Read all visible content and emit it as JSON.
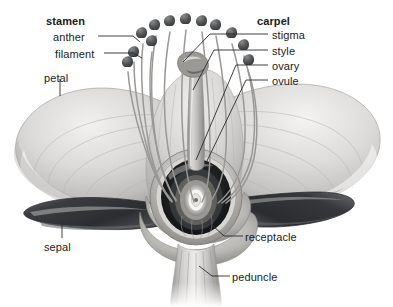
{
  "figure": {
    "background_color": "#ffffff",
    "label_color": "#1a1a1a",
    "leader_color": "#2b2b2b"
  },
  "labels": {
    "stamen": {
      "text": "stamen",
      "x": 46,
      "y": 16,
      "bold": true,
      "align": "left"
    },
    "anther": {
      "text": "anther",
      "x": 53,
      "y": 32,
      "bold": false,
      "align": "left"
    },
    "filament": {
      "text": "filament",
      "x": 55,
      "y": 49,
      "bold": false,
      "align": "left"
    },
    "petal": {
      "text": "petal",
      "x": 44,
      "y": 73,
      "bold": false,
      "align": "left"
    },
    "carpel": {
      "text": "carpel",
      "x": 257,
      "y": 16,
      "bold": true,
      "align": "left"
    },
    "stigma": {
      "text": "stigma",
      "x": 272,
      "y": 30,
      "bold": false,
      "align": "left"
    },
    "style": {
      "text": "style",
      "x": 272,
      "y": 46,
      "bold": false,
      "align": "left"
    },
    "ovary": {
      "text": "ovary",
      "x": 272,
      "y": 61,
      "bold": false,
      "align": "left"
    },
    "ovule": {
      "text": "ovule",
      "x": 272,
      "y": 76,
      "bold": false,
      "align": "left"
    },
    "sepal": {
      "text": "sepal",
      "x": 44,
      "y": 242,
      "bold": false,
      "align": "left"
    },
    "receptacle": {
      "text": "receptacle",
      "x": 245,
      "y": 232,
      "bold": false,
      "align": "left"
    },
    "peduncle": {
      "text": "peduncle",
      "x": 232,
      "y": 272,
      "bold": false,
      "align": "left"
    }
  },
  "leaders": {
    "anther": "M98,36 L133,36 L140,42",
    "filament": "M104,53 L133,53 L142,58",
    "petal": "M60,79 L60,96",
    "stigma": "M268,34 L210,34 L183,62",
    "style": "M268,50 L214,50 L193,90",
    "ovary": "M268,65 L236,65 L196,160",
    "ovule": "M268,80 L246,80 L206,163",
    "sepal": "M62,238 L62,222",
    "receptacle": "M243,236 L224,236 L213,226",
    "peduncle": "M230,276 L212,276 L199,266"
  },
  "structures": {
    "petal_left": "large pale lobe extending left with curved veins",
    "petal_right": "large pale lobe extending right with curved veins",
    "sepal_left": "dark narrow blade pointing lower-left",
    "sepal_right": "dark narrow blade pointing lower-right",
    "receptacle": "swollen base holding ovary chamber",
    "peduncle": "striated vertical stem below receptacle",
    "ovary": "dark oval chamber at flower center",
    "ovule": "bright concentric oval at ovary center",
    "style": "thick pale column rising from ovary",
    "stigma": "knobbed tip atop the style",
    "stamen_count": 12
  },
  "palette": {
    "petal_light": "#eceaea",
    "petal_mid": "#c9c7c7",
    "petal_shadow": "#a3a1a1",
    "sepal_dark": "#3f4144",
    "sepal_darker": "#2a2c2f",
    "stem_mid": "#9b9997",
    "ovary_dark": "#1e2022",
    "ovule_bright": "#f6f5f3",
    "anther_dark": "#55575a"
  }
}
